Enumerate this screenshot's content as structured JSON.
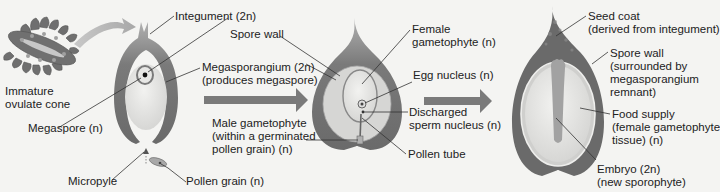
{
  "colors": {
    "background": "#f4f4f2",
    "integument": "#6e6e6e",
    "integument_light": "#9a9a9a",
    "megasporangium": "#d8d8d6",
    "megaspore_fill": "#ededeb",
    "arrow": "#7a7a7a",
    "leader": "#333333",
    "text": "#222222"
  },
  "cone": {
    "label_line1": "Immature",
    "label_line2": "ovulate cone"
  },
  "stage1": {
    "integument": "Integument (2n)",
    "spore_wall": "Spore wall",
    "megasporangium_line1": "Megasporangium (2n)",
    "megasporangium_line2": "(produces megaspore)",
    "megaspore": "Megaspore (n)",
    "micropyle": "Micropyle",
    "pollen_grain": "Pollen grain (n)"
  },
  "stage2": {
    "female_gametophyte_line1": "Female",
    "female_gametophyte_line2": "gametophyte (n)",
    "egg_nucleus": "Egg nucleus (n)",
    "male_gametophyte_line1": "Male gametophyte",
    "male_gametophyte_line2": "(within a germinated",
    "male_gametophyte_line3": "pollen grain) (n)",
    "discharged_line1": "Discharged",
    "discharged_line2": "sperm nucleus (n)",
    "pollen_tube": "Pollen tube"
  },
  "stage3": {
    "seed_coat_line1": "Seed coat",
    "seed_coat_line2": "(derived from integument)",
    "spore_wall_line1": "Spore wall",
    "spore_wall_line2": "(surrounded by",
    "spore_wall_line3": "megasporangium",
    "spore_wall_line4": "remnant)",
    "food_supply_line1": "Food supply",
    "food_supply_line2": "(female gametophyte",
    "food_supply_line3": "tissue) (n)",
    "embryo_line1": "Embryo (2n)",
    "embryo_line2": "(new sporophyte)"
  }
}
